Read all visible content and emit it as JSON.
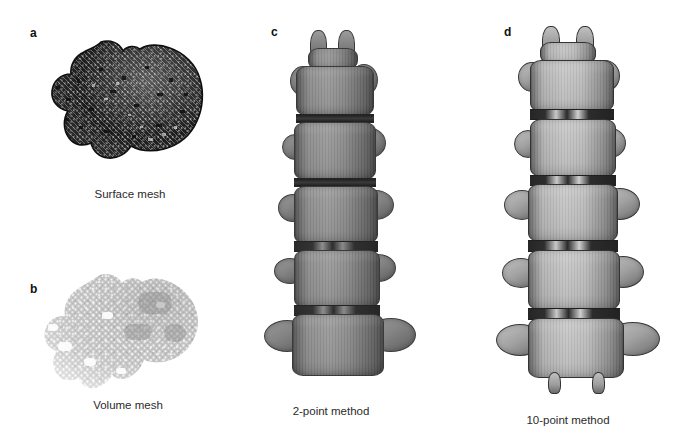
{
  "figure": {
    "background_color": "#ffffff",
    "panel_count": 4,
    "panels": [
      {
        "id": "a",
        "label": "a",
        "caption": "Surface mesh",
        "subject": "vertebra",
        "render_style": "triangulated-surface-mesh",
        "dominant_color": "#4a4a4a",
        "accent_color": "#111111"
      },
      {
        "id": "b",
        "label": "b",
        "caption": "Volume mesh",
        "subject": "vertebra",
        "render_style": "tetrahedral-volume-mesh-point-cloud",
        "dominant_color": "#c9c9c9",
        "accent_color": "#e2e2e2"
      },
      {
        "id": "c",
        "label": "c",
        "caption": "2-point method",
        "subject": "lumbar-spine-segment",
        "render_style": "volume-rendered-grayscale",
        "dominant_color": "#8d8d8d",
        "accent_color": "#2b2b2b",
        "vertebra_count": 5
      },
      {
        "id": "d",
        "label": "d",
        "caption": "10-point method",
        "subject": "lumbar-spine-segment",
        "render_style": "volume-rendered-grayscale",
        "dominant_color": "#bdbdbd",
        "accent_color": "#2b2b2b",
        "vertebra_count": 5
      }
    ]
  }
}
